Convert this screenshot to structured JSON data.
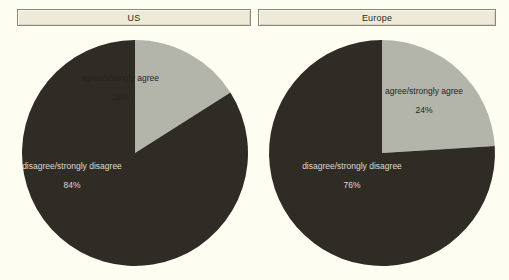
{
  "panels": [
    {
      "title": "US"
    },
    {
      "title": "Europe"
    }
  ],
  "colors": {
    "background": "#fdfdf2",
    "slice_agree": "#b3b5ab",
    "slice_disagree": "#2e2c24",
    "title_bar_fill": "#eeead9",
    "title_bar_border": "#8b8878",
    "label_dark_text": "#24241c",
    "label_light_text": "#dedad0"
  },
  "labels": {
    "us": {
      "agree_name": "agree/strongly agree",
      "agree_pct": "16%",
      "disagree_name": "disagree/strongly disagree",
      "disagree_pct": "84%"
    },
    "europe": {
      "agree_name": "agree/strongly agree",
      "agree_pct": "24%",
      "disagree_name": "disagree/strongly disagree",
      "disagree_pct": "76%"
    }
  },
  "chart_data": [
    {
      "type": "pie",
      "title": "US",
      "categories": [
        "agree/strongly agree",
        "disagree/strongly disagree"
      ],
      "values": [
        16,
        84
      ],
      "value_labels": [
        "16%",
        "84%"
      ],
      "colors": [
        "#b3b5ab",
        "#2e2c24"
      ],
      "start_angle_deg": 0,
      "direction": "clockwise",
      "units": "percent",
      "legend": "none",
      "grid": false
    },
    {
      "type": "pie",
      "title": "Europe",
      "categories": [
        "agree/strongly agree",
        "disagree/strongly disagree"
      ],
      "values": [
        24,
        76
      ],
      "value_labels": [
        "24%",
        "76%"
      ],
      "colors": [
        "#b3b5ab",
        "#2e2c24"
      ],
      "start_angle_deg": 0,
      "direction": "clockwise",
      "units": "percent",
      "legend": "none",
      "grid": false
    }
  ]
}
